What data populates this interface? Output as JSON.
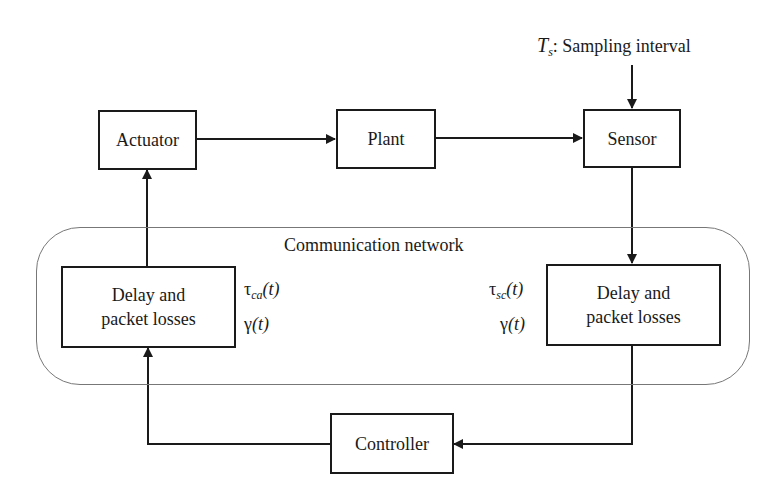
{
  "diagram": {
    "type": "networked-control-system-block-diagram",
    "sampling": {
      "symbol": "T",
      "subscript": "s",
      "text": ": Sampling interval"
    },
    "blocks": {
      "actuator": "Actuator",
      "plant": "Plant",
      "sensor": "Sensor",
      "controller": "Controller",
      "delay_left_line1": "Delay and",
      "delay_left_line2": "packet losses",
      "delay_right_line1": "Delay and",
      "delay_right_line2": "packet losses"
    },
    "network": {
      "label": "Communication network"
    },
    "left_params": {
      "tau_symbol": "τ",
      "tau_sub": "ca",
      "tau_arg": "(t)",
      "gamma_symbol": "γ",
      "gamma_arg": "(t)"
    },
    "right_params": {
      "tau_symbol": "τ",
      "tau_sub": "sc",
      "tau_arg": "(t)",
      "gamma_symbol": "γ",
      "gamma_arg": "(t)"
    },
    "connections": [
      {
        "from": "Actuator",
        "to": "Plant"
      },
      {
        "from": "Plant",
        "to": "Sensor"
      },
      {
        "from": "Sampling interval",
        "to": "Sensor"
      },
      {
        "from": "Sensor",
        "to": "Delay and packet losses (sc)"
      },
      {
        "from": "Delay and packet losses (sc)",
        "to": "Controller"
      },
      {
        "from": "Controller",
        "to": "Delay and packet losses (ca)"
      },
      {
        "from": "Delay and packet losses (ca)",
        "to": "Actuator"
      }
    ]
  }
}
